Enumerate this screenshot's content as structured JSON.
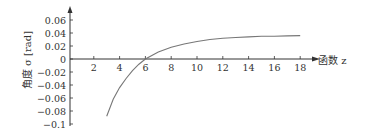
{
  "chart_data": {
    "type": "line",
    "title": "",
    "xlabel": "函数 z",
    "ylabel": "角度 σ [rad]",
    "xlim": [
      0,
      19.5
    ],
    "ylim": [
      -0.1,
      0.07
    ],
    "x_ticks": [
      "2",
      "4",
      "6",
      "8",
      "10",
      "12",
      "14",
      "16",
      "18"
    ],
    "y_ticks": [
      "0.06",
      "0.04",
      "0.02",
      "0",
      "−0.02",
      "−0.04",
      "−0.06",
      "−0.08",
      "−0.1"
    ],
    "grid": false,
    "legend": null,
    "series": [
      {
        "name": "σ(z)",
        "x": [
          3,
          3.5,
          4,
          4.5,
          5,
          5.5,
          6,
          7,
          8,
          9,
          10,
          11,
          12,
          13,
          14,
          15,
          16,
          17,
          18
        ],
        "y": [
          -0.088,
          -0.062,
          -0.044,
          -0.03,
          -0.018,
          -0.008,
          0.0,
          0.011,
          0.018,
          0.023,
          0.027,
          0.03,
          0.032,
          0.033,
          0.034,
          0.035,
          0.035,
          0.0355,
          0.036
        ]
      }
    ]
  },
  "labels": {
    "xlabel": "函数 z",
    "ylabel_cn": "角度",
    "ylabel_sym": "σ [rad]"
  }
}
